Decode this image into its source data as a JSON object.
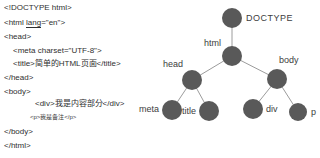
{
  "code": {
    "line1": "<!DOCTYPE html>",
    "line2_pre": "<html ",
    "line2_attr": "lang",
    "line2_post": "=\"en\">",
    "line3": "<head>",
    "line4": "<meta charset=\"UTF-8\">",
    "line5": "<title>简单的HTML页面</title>",
    "line6": "</head>",
    "line7": "<body>",
    "line8": "<div>我是内容部分</div>",
    "line9": "<p>我是备注</p>",
    "line10": "</body>",
    "line11": "</html>"
  },
  "tree": {
    "node_color": "#595959",
    "edge_color": "#9c9c9c",
    "label_color": "#3d3d3d",
    "labels": {
      "doctype": "DOCTYPE",
      "html": "html",
      "head": "head",
      "body": "body",
      "meta": "meta",
      "title": "title",
      "div": "div",
      "p": "p"
    }
  }
}
